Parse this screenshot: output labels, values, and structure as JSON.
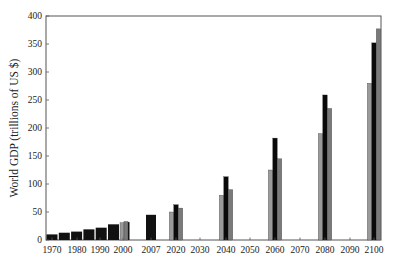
{
  "chart_data": {
    "type": "bar",
    "title": "",
    "xlabel": "",
    "ylabel": "World GDP (trillions of US $)",
    "ylim": [
      0,
      400
    ],
    "yticks": [
      0,
      50,
      100,
      150,
      200,
      250,
      300,
      350,
      400
    ],
    "xticks": [
      "1970",
      "1980",
      "1990",
      "2000",
      "2007",
      "2020",
      "2030",
      "2040",
      "2050",
      "2060",
      "2070",
      "2080",
      "2090",
      "2100"
    ],
    "grid": false,
    "legend": null,
    "colors": {
      "historical": "#111111",
      "scenario_low": "#9a9a9a",
      "scenario_mid": "#0a0a0a",
      "scenario_high": "#7a7a7a",
      "axis": "#555555"
    },
    "historical": {
      "name": "Historical",
      "x": [
        1970,
        1975,
        1980,
        1985,
        1990,
        1995,
        2000,
        2007
      ],
      "values": [
        10,
        13,
        15,
        19,
        22,
        28,
        32,
        45
      ]
    },
    "series": [
      {
        "name": "Scenario A (light gray)",
        "x": [
          2000,
          2020,
          2040,
          2060,
          2080,
          2100
        ],
        "values": [
          31,
          50,
          80,
          125,
          190,
          280
        ]
      },
      {
        "name": "Scenario B (black)",
        "x": [
          2020,
          2040,
          2060,
          2080,
          2100
        ],
        "values": [
          63,
          113,
          182,
          259,
          352
        ]
      },
      {
        "name": "Scenario C (gray)",
        "x": [
          2000,
          2020,
          2040,
          2060,
          2080,
          2100
        ],
        "values": [
          33,
          57,
          90,
          145,
          235,
          377
        ]
      }
    ]
  }
}
